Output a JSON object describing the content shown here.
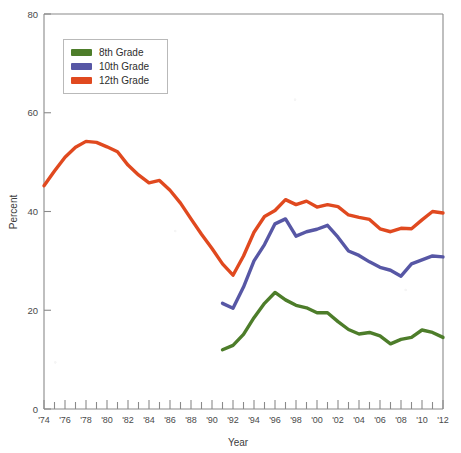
{
  "chart_data": {
    "type": "line",
    "title": "",
    "xlabel": "Year",
    "ylabel": "Percent",
    "ylim": [
      0,
      80
    ],
    "xlim": [
      1974,
      2012
    ],
    "yticks": [
      0,
      20,
      40,
      60,
      80
    ],
    "ytick_labels": [
      "0",
      "20",
      "40",
      "60",
      "80"
    ],
    "xtick_labels": [
      "'74",
      "'76",
      "'78",
      "'80",
      "'82",
      "'84",
      "'86",
      "'88",
      "'90",
      "'92",
      "'94",
      "'96",
      "'98",
      "'00",
      "'02",
      "'04",
      "'06",
      "'08",
      "'10",
      "'12"
    ],
    "xtick_years": [
      1974,
      1976,
      1978,
      1980,
      1982,
      1984,
      1986,
      1988,
      1990,
      1992,
      1994,
      1996,
      1998,
      2000,
      2002,
      2004,
      2006,
      2008,
      2010,
      2012
    ],
    "minor_tick_years": [
      1975,
      1977,
      1979,
      1981,
      1983,
      1985,
      1987,
      1989,
      1991,
      1993,
      1995,
      1997,
      1999,
      2001,
      2003,
      2005,
      2007,
      2009,
      2011
    ],
    "grid": false,
    "legend_position": "top-left-inside",
    "series": [
      {
        "name": "8th Grade",
        "color": "#4d7d2a",
        "x": [
          1991,
          1992,
          1993,
          1994,
          1995,
          1996,
          1997,
          1998,
          1999,
          2000,
          2001,
          2002,
          2003,
          2004,
          2005,
          2006,
          2007,
          2008,
          2009,
          2010,
          2011,
          2012
        ],
        "values": [
          12.0,
          12.9,
          15.1,
          18.5,
          21.4,
          23.6,
          22.1,
          21.0,
          20.5,
          19.5,
          19.5,
          17.7,
          16.1,
          15.2,
          15.5,
          14.8,
          13.2,
          14.1,
          14.5,
          16.0,
          15.5,
          14.5
        ]
      },
      {
        "name": "10th Grade",
        "color": "#5757a5",
        "x": [
          1991,
          1992,
          1993,
          1994,
          1995,
          1996,
          1997,
          1998,
          1999,
          2000,
          2001,
          2002,
          2003,
          2004,
          2005,
          2006,
          2007,
          2008,
          2009,
          2010,
          2011,
          2012
        ],
        "values": [
          21.4,
          20.4,
          24.7,
          30.0,
          33.3,
          37.5,
          38.5,
          35.0,
          35.9,
          36.4,
          37.2,
          34.8,
          32.0,
          31.1,
          29.8,
          28.7,
          28.1,
          26.9,
          29.4,
          30.2,
          31.0,
          30.8
        ]
      },
      {
        "name": "12th Grade",
        "color": "#e0491f",
        "x": [
          1974,
          1975,
          1976,
          1977,
          1978,
          1979,
          1980,
          1981,
          1982,
          1983,
          1984,
          1985,
          1986,
          1987,
          1988,
          1989,
          1990,
          1991,
          1992,
          1993,
          1994,
          1995,
          1996,
          1997,
          1998,
          1999,
          2000,
          2001,
          2002,
          2003,
          2004,
          2005,
          2006,
          2007,
          2008,
          2009,
          2010,
          2011,
          2012
        ],
        "values": [
          45.2,
          48.2,
          51.0,
          53.0,
          54.2,
          54.0,
          53.1,
          52.1,
          49.4,
          47.4,
          45.8,
          46.3,
          44.3,
          41.7,
          38.5,
          35.4,
          32.5,
          29.4,
          27.1,
          31.0,
          35.8,
          39.0,
          40.2,
          42.4,
          41.4,
          42.1,
          40.9,
          41.4,
          41.0,
          39.3,
          38.8,
          38.4,
          36.5,
          35.9,
          36.6,
          36.5,
          38.3,
          40.0,
          39.7
        ]
      }
    ]
  },
  "legend": {
    "items": [
      {
        "label": "8th Grade",
        "color": "#4d7d2a"
      },
      {
        "label": "10th Grade",
        "color": "#5757a5"
      },
      {
        "label": "12th Grade",
        "color": "#e0491f"
      }
    ]
  },
  "axes": {
    "y_title": "Percent",
    "x_title": "Year"
  }
}
